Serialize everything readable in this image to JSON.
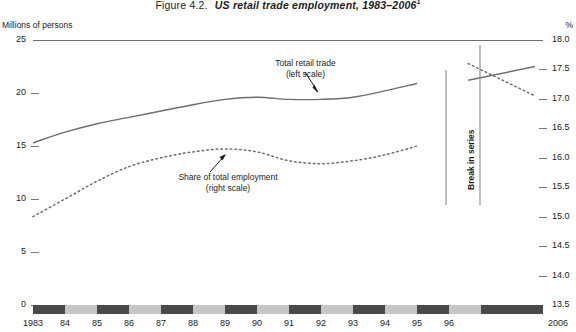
{
  "title": {
    "number": "Figure 4.2.",
    "name": "US retail trade employment, 1983–2006",
    "footnote_marker": "1"
  },
  "axis_unit_left": "Millions of persons",
  "axis_unit_right": "%",
  "annotations": {
    "series1_line1": "Total retail trade",
    "series1_line2": "(left scale)",
    "series2_line1": "Share of total employment",
    "series2_line2": "(right scale)",
    "break": "Break in series"
  },
  "colors": {
    "line_solid": "#6e6e6e",
    "line_dotted": "#6e6e6e",
    "band_dark": "#4a4a4a",
    "band_light": "#c6c6c6",
    "axis": "#777777",
    "text": "#1c1c1c"
  },
  "chart_data": {
    "type": "line",
    "title": "US retail trade employment, 1983–2006",
    "xlabel": "",
    "ylabel": "Millions of persons",
    "y2label": "%",
    "ylim": [
      0,
      25
    ],
    "y2lim": [
      13.5,
      18.0
    ],
    "yticks": [
      25,
      20,
      15,
      10,
      5,
      0
    ],
    "y2ticks": [
      18.0,
      17.5,
      17.0,
      16.5,
      16.0,
      15.5,
      15.0,
      14.5,
      14.0,
      13.5
    ],
    "xticklabels": [
      "1983",
      "84",
      "85",
      "86",
      "87",
      "88",
      "89",
      "90",
      "91",
      "92",
      "93",
      "94",
      "95",
      "96",
      "2006"
    ],
    "grid": false,
    "legend": "annotations",
    "break_in_series": {
      "label": "Break in series",
      "between": [
        "1995",
        "1996"
      ]
    },
    "series": [
      {
        "name": "Total retail trade (left scale)",
        "axis": "left",
        "style": "solid",
        "units": "millions of persons",
        "x": [
          "1983",
          "84",
          "85",
          "86",
          "87",
          "88",
          "89",
          "90",
          "91",
          "92",
          "93",
          "94",
          "95"
        ],
        "values": [
          15.3,
          16.3,
          17.1,
          17.7,
          18.3,
          18.9,
          19.4,
          19.6,
          19.4,
          19.4,
          19.6,
          20.2,
          20.9
        ],
        "x_after_break": [
          "96",
          "2006"
        ],
        "values_after_break": [
          21.2,
          22.5
        ]
      },
      {
        "name": "Share of total employment (right scale)",
        "axis": "right",
        "style": "dotted",
        "units": "percent",
        "x": [
          "1983",
          "84",
          "85",
          "86",
          "87",
          "88",
          "89",
          "90",
          "91",
          "92",
          "93",
          "94",
          "95"
        ],
        "values": [
          15.0,
          15.3,
          15.6,
          15.85,
          16.0,
          16.1,
          16.15,
          16.1,
          15.95,
          15.9,
          15.95,
          16.05,
          16.2
        ],
        "x_after_break": [
          "96",
          "2006"
        ],
        "values_after_break": [
          17.6,
          17.05
        ]
      }
    ]
  }
}
